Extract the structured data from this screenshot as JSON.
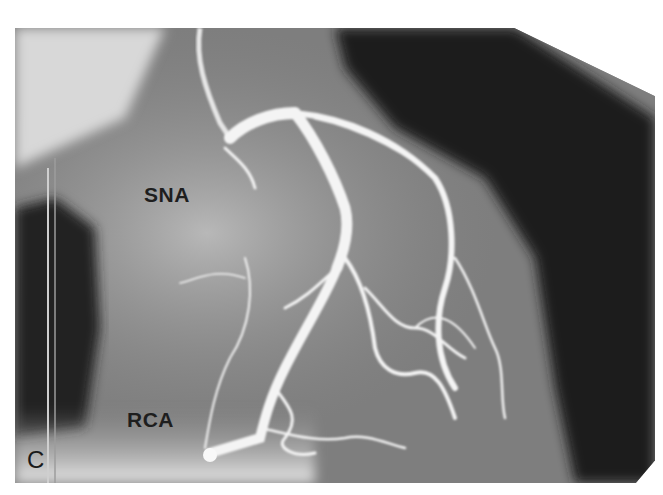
{
  "figure": {
    "panel_label": "C",
    "annotations": [
      {
        "id": "sna",
        "text": "SNA"
      },
      {
        "id": "rca",
        "text": "RCA"
      }
    ],
    "colors": {
      "background": "#ffffff",
      "vessel": "#f2f2f2",
      "dark_field": "#1c1c1c",
      "mid_field": "#8a8a8a",
      "label_text": "#1e1e1e"
    }
  }
}
